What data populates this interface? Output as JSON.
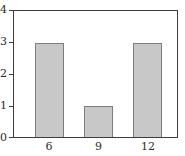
{
  "chart_data": {
    "type": "bar",
    "categories": [
      "6",
      "9",
      "12"
    ],
    "values": [
      3,
      1,
      3
    ],
    "title": "",
    "xlabel": "",
    "ylabel": "",
    "ylim": [
      0,
      4
    ],
    "yticks": [
      0,
      1,
      2,
      3,
      4
    ],
    "grid": false,
    "legend": "none",
    "bar_fill_color": "#c8c8c8",
    "bar_border_color": "#7d7d7d",
    "axis_color": "#3d3d3d",
    "background_color": "#ffffff",
    "bar_centers_pct": [
      21.8,
      51.8,
      81.8
    ],
    "bar_width_pct": 18.2
  }
}
